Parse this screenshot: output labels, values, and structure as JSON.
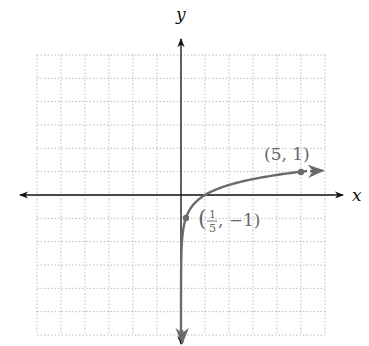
{
  "chart_data": {
    "type": "line",
    "title": "",
    "function": "y = log_5(x)",
    "xlabel": "x",
    "ylabel": "y",
    "xlim": [
      -6,
      6
    ],
    "ylim": [
      -6,
      6
    ],
    "grid": true,
    "grid_style": "dotted",
    "series": [
      {
        "name": "log5(x)",
        "color": "#6b6b6b",
        "x": [
          0.0002,
          0.001,
          0.008,
          0.04,
          0.2,
          0.5,
          1,
          2,
          3,
          4,
          5,
          6
        ],
        "values": [
          -5.3,
          -4.29,
          -3.0,
          -2.0,
          -1,
          -0.43,
          0,
          0.43,
          0.68,
          0.86,
          1,
          1.11
        ]
      }
    ],
    "points": [
      {
        "x": 5,
        "y": 1,
        "label": "(5, 1)"
      },
      {
        "x": 0.2,
        "y": -1,
        "label": "(1/5, −1)"
      }
    ],
    "annotations": [
      "(5, 1)",
      "(1/5, −1)"
    ]
  },
  "labels": {
    "x_axis": "x",
    "y_axis": "y",
    "point1": "(5, 1)",
    "point2_open": "(",
    "point2_num": "1",
    "point2_den": "5",
    "point2_rest": ", −1)"
  },
  "colors": {
    "axis": "#111111",
    "grid": "#aaaaaa",
    "curve": "#6b6b6b"
  }
}
